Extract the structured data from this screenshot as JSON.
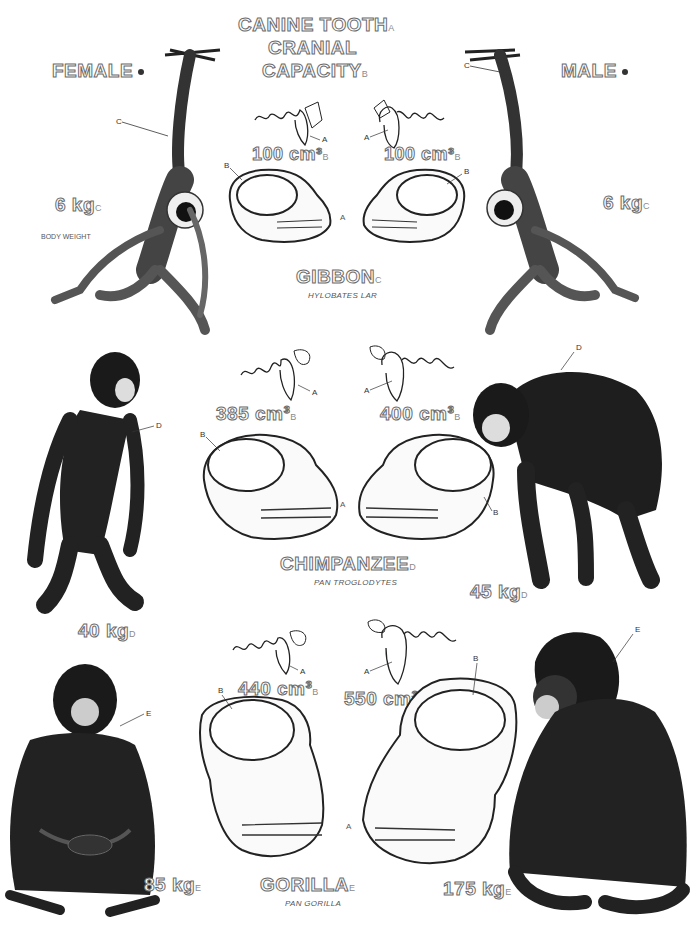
{
  "header": {
    "title_line1": "CANINE TOOTH",
    "title_line1_key": "A",
    "title_line2": "CRANIAL",
    "title_line3": "CAPACITY",
    "title_line3_key": "B",
    "female_label": "FEMALE",
    "male_label": "MALE"
  },
  "legend": {
    "body_weight_label": "BODY WEIGHT"
  },
  "species": [
    {
      "name": "GIBBON",
      "key": "C",
      "latin": "HYLOBATES LAR",
      "female_weight": "6 kg",
      "male_weight": "6 kg",
      "female_cranial": "100 cm³",
      "male_cranial": "100 cm³"
    },
    {
      "name": "CHIMPANZEE",
      "key": "D",
      "latin": "PAN TROGLODYTES",
      "female_weight": "40 kg",
      "male_weight": "45 kg",
      "female_cranial": "385 cm³",
      "male_cranial": "400 cm³"
    },
    {
      "name": "GORILLA",
      "key": "E",
      "latin": "PAN GORILLA",
      "female_weight": "85 kg",
      "male_weight": "175 kg",
      "female_cranial": "440 cm³",
      "male_cranial": "550 cm³"
    }
  ],
  "labels": {
    "canine": "A",
    "cranial": "B",
    "gibbon": "C",
    "chimp": "D",
    "gorilla": "E"
  }
}
